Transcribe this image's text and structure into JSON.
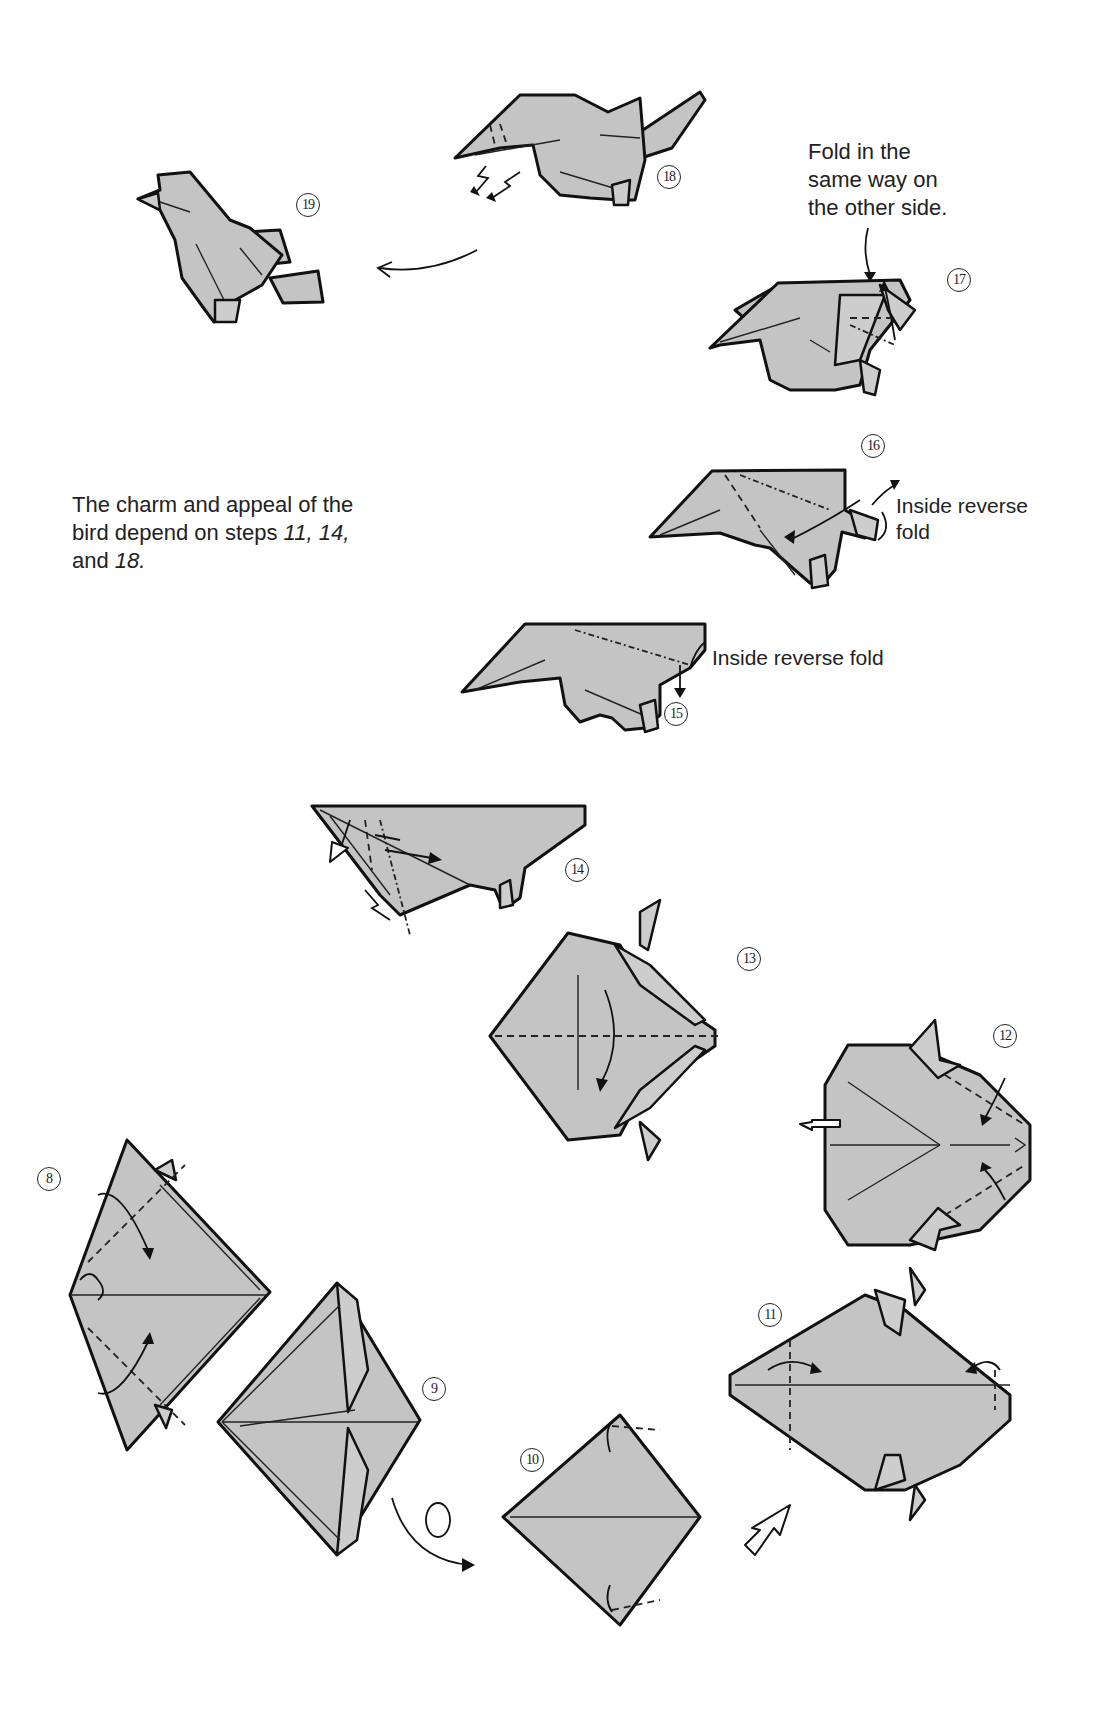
{
  "page": {
    "background": "#ffffff",
    "paper_color": "#c4c4c4",
    "line_color": "#111111"
  },
  "notes": {
    "same_way": {
      "line1": "Fold in the",
      "line2": "same way on",
      "line3": "the other side."
    },
    "charm": {
      "line1": "The charm and appeal of the",
      "line2_prefix": "bird depend on steps ",
      "line2_steps": "11, 14,",
      "line3_prefix": "and ",
      "line3_steps": "18."
    }
  },
  "labels": {
    "step16": {
      "line1": "Inside reverse",
      "line2": "fold"
    },
    "step15": {
      "text": "Inside reverse fold"
    }
  },
  "steps": [
    {
      "number": "8",
      "description": "squash-folded diamond with flap arrows"
    },
    {
      "number": "9",
      "description": "narrowed diamond"
    },
    {
      "number": "10",
      "description": "turned over diamond with corner folds"
    },
    {
      "number": "11",
      "description": "hexagonal base with valley folds"
    },
    {
      "number": "12",
      "description": "hexagon with pull-out arrow"
    },
    {
      "number": "13",
      "description": "diamond folded in half"
    },
    {
      "number": "14",
      "description": "triangle with crimp fold"
    },
    {
      "number": "15",
      "description": "bird body inside reverse fold"
    },
    {
      "number": "16",
      "description": "tail inside reverse fold"
    },
    {
      "number": "17",
      "description": "wing fold"
    },
    {
      "number": "18",
      "description": "head crimp fold"
    },
    {
      "number": "19",
      "description": "finished bird"
    }
  ],
  "step_labels": {
    "s8": "8",
    "s9": "9",
    "s10": "10",
    "s11": "11",
    "s12": "12",
    "s13": "13",
    "s14": "14",
    "s15": "15",
    "s16": "16",
    "s17": "17",
    "s18": "18",
    "s19": "19"
  }
}
